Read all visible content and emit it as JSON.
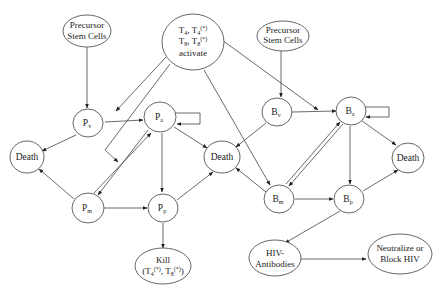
{
  "nodes": {
    "precursor_left": {
      "line1": "Precursor",
      "line2": "Stem Cells"
    },
    "precursor_right": {
      "line1": "Precursor",
      "line2": "Stem Cells"
    },
    "t_activate": {
      "l1a": "T",
      "l1a_sub": "4",
      "l1b": ", T",
      "l1b_sub": "4",
      "l1b_sup": "(*)",
      "l2a": "T",
      "l2a_sub": "8",
      "l2b": ", T",
      "l2b_sub": "8",
      "l2b_sup": "(*)",
      "line3": "activate"
    },
    "p_v": {
      "main": "P",
      "sub": "v"
    },
    "p_a": {
      "main": "P",
      "sub": "a"
    },
    "p_m": {
      "main": "P",
      "sub": "m"
    },
    "p_p": {
      "main": "P",
      "sub": "p"
    },
    "b_v": {
      "main": "B",
      "sub": "v"
    },
    "b_a": {
      "main": "B",
      "sub": "a"
    },
    "b_m": {
      "main": "B",
      "sub": "m"
    },
    "b_p": {
      "main": "B",
      "sub": "p"
    },
    "death_left": {
      "label": "Death"
    },
    "death_center": {
      "label": "Death"
    },
    "death_right": {
      "label": "Death"
    },
    "kill": {
      "line1": "Kill",
      "l2_open": "(T",
      "l2_sub1": "4",
      "l2_sup1": "(*)",
      "l2_mid": ", T",
      "l2_sub2": "8",
      "l2_sup2": "(*)",
      "l2_close": ")"
    },
    "hiv_antibodies": {
      "line1": "HIV-",
      "line2": "Antibodies"
    },
    "neutralize": {
      "line1": "Neutralize or",
      "line2": "Block HIV"
    }
  },
  "edges": [
    {
      "from": "precursor_left",
      "to": "p_v"
    },
    {
      "from": "precursor_right",
      "to": "b_v"
    },
    {
      "from": "t_activate",
      "to": "p_v-p_a edge"
    },
    {
      "from": "t_activate",
      "to": "p_m-p_a region"
    },
    {
      "from": "t_activate",
      "to": "b_v-b_a edge"
    },
    {
      "from": "t_activate",
      "to": "b_m"
    },
    {
      "from": "p_v",
      "to": "p_a"
    },
    {
      "from": "p_v",
      "to": "death_left"
    },
    {
      "from": "p_m",
      "to": "death_left"
    },
    {
      "from": "p_a",
      "to": "p_a",
      "type": "self-loop"
    },
    {
      "from": "p_a",
      "to": "p_m"
    },
    {
      "from": "p_m",
      "to": "p_a"
    },
    {
      "from": "p_a",
      "to": "p_p"
    },
    {
      "from": "p_a",
      "to": "death_center"
    },
    {
      "from": "p_m",
      "to": "p_p"
    },
    {
      "from": "p_p",
      "to": "death_center"
    },
    {
      "from": "p_p",
      "to": "kill"
    },
    {
      "from": "b_v",
      "to": "b_a"
    },
    {
      "from": "b_v",
      "to": "death_center"
    },
    {
      "from": "b_m",
      "to": "death_center"
    },
    {
      "from": "b_a",
      "to": "b_a",
      "type": "self-loop"
    },
    {
      "from": "b_a",
      "to": "b_m"
    },
    {
      "from": "b_m",
      "to": "b_a"
    },
    {
      "from": "b_a",
      "to": "b_p"
    },
    {
      "from": "b_a",
      "to": "death_right"
    },
    {
      "from": "b_m",
      "to": "b_p"
    },
    {
      "from": "b_p",
      "to": "death_right"
    },
    {
      "from": "b_p",
      "to": "hiv_antibodies"
    },
    {
      "from": "hiv_antibodies",
      "to": "neutralize"
    }
  ]
}
